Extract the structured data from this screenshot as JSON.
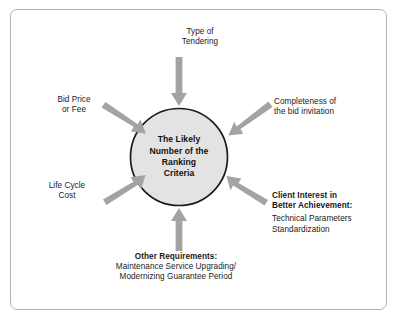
{
  "diagram": {
    "type": "radial-influence-diagram",
    "center": {
      "name": "center-node",
      "lines": [
        "The Likely",
        "Number of the",
        "Ranking",
        "Criteria"
      ],
      "fill_color": "#e3e3e3",
      "stroke_color": "#1a1a1a"
    },
    "arrow_color": "#a3a3a3",
    "frame_color": "#b4b4b4",
    "factors": [
      {
        "id": "type-of-tendering",
        "position": "top",
        "align": "center",
        "heading": "",
        "lines": [
          "Type of",
          "Tendering"
        ]
      },
      {
        "id": "completeness-of-bid-invitation",
        "position": "top-right",
        "align": "left",
        "heading": "",
        "lines": [
          "Completeness of",
          "the bid invitation"
        ]
      },
      {
        "id": "bid-price-or-fee",
        "position": "top-left",
        "align": "center",
        "heading": "",
        "lines": [
          "Bid Price",
          "or Fee"
        ]
      },
      {
        "id": "life-cycle-cost",
        "position": "left",
        "align": "center",
        "heading": "",
        "lines": [
          "Life Cycle",
          "Cost"
        ]
      },
      {
        "id": "client-interest-in-better-achievement",
        "position": "bottom-right",
        "align": "left",
        "heading_lines": [
          "Client Interest in",
          "Better Achievement:"
        ],
        "lines": [
          "Technical Parameters",
          "Standardization"
        ]
      },
      {
        "id": "other-requirements",
        "position": "bottom",
        "align": "center",
        "heading_lines": [
          "Other Requirements:"
        ],
        "lines": [
          "Maintenance Service Upgrading/",
          "Modernizing Guarantee Period"
        ]
      }
    ]
  }
}
